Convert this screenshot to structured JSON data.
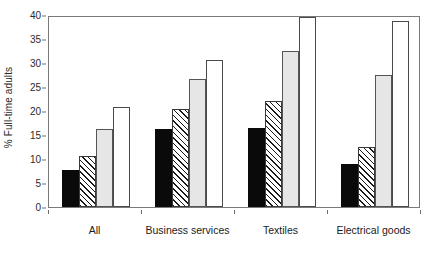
{
  "chart_data": {
    "type": "bar",
    "title": "",
    "xlabel": "",
    "ylabel": "% Full-time adults",
    "ylim": [
      0,
      40
    ],
    "ytick_labels": [
      "0",
      "5",
      "10",
      "15",
      "20",
      "25",
      "30",
      "35",
      "40"
    ],
    "ytick_values": [
      0,
      5,
      10,
      15,
      20,
      25,
      30,
      35,
      40
    ],
    "grid": false,
    "legend": "none",
    "categories": [
      "All",
      "Business services",
      "Textiles",
      "Electrical goods"
    ],
    "series": [
      {
        "name": "series-1",
        "fill": "black",
        "values": [
          7.8,
          16.2,
          16.5,
          9.0
        ]
      },
      {
        "name": "series-2",
        "fill": "diagonal-hatch",
        "values": [
          10.6,
          20.4,
          22.1,
          12.5
        ]
      },
      {
        "name": "series-3",
        "fill": "light-gray",
        "values": [
          16.2,
          26.6,
          32.6,
          27.4
        ]
      },
      {
        "name": "series-4",
        "fill": "white",
        "values": [
          20.8,
          30.7,
          39.6,
          38.7
        ]
      }
    ]
  },
  "colors": {
    "series_black": "#0a0a0a",
    "series_hatch_line": "#1a1a1a",
    "series_gray": "#e6e6e6",
    "series_white": "#ffffff",
    "axis": "#7a7a7a",
    "text": "#1a1a1a",
    "background": "#ffffff"
  }
}
